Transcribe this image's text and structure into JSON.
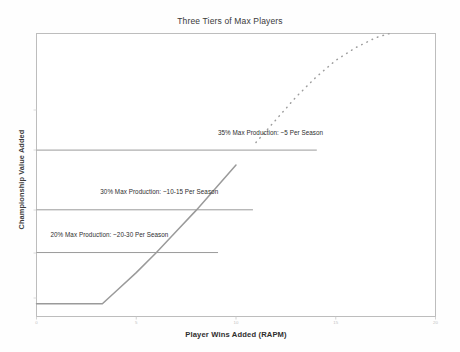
{
  "chart_data": {
    "type": "line",
    "title": "Three Tiers of Max Players",
    "xlabel": "Player Wins Added (RAPM)",
    "ylabel": "Championship Value Added",
    "xlim": [
      0,
      20
    ],
    "ylim": [
      0,
      1
    ],
    "grid": false,
    "legend": null,
    "xticks": [
      0,
      5,
      10,
      15,
      20
    ],
    "xtick_labels": [
      "0",
      "5",
      "10",
      "15",
      "20"
    ],
    "yticks": [],
    "ytick_labels": [],
    "series": [
      {
        "name": "Championship Value Curve",
        "style": "solid-then-dotted",
        "color": "#9a9a9a",
        "x": [
          0.0,
          1.0,
          2.0,
          3.0,
          3.3,
          4.0,
          5.0,
          6.0,
          7.0,
          8.0,
          9.0,
          10.0,
          11.0,
          12.0,
          13.0,
          14.0,
          15.0,
          16.0,
          17.0,
          17.7
        ],
        "y": [
          0.045,
          0.045,
          0.045,
          0.045,
          0.045,
          0.09,
          0.155,
          0.225,
          0.3,
          0.375,
          0.455,
          0.535,
          0.615,
          0.695,
          0.775,
          0.845,
          0.905,
          0.95,
          0.985,
          1.0
        ],
        "dotted_from_x": 10.2
      }
    ],
    "threshold_lines": [
      {
        "id": "tier-35",
        "label": "35% Max Production: ~5 Per Season",
        "y_value": 0.588,
        "x_start": 0,
        "x_end": 14.05,
        "label_x": 9.1,
        "label_y": 0.645,
        "color": "#8f8f8f"
      },
      {
        "id": "tier-30",
        "label": "30% Max Production: ~10-15 Per Season",
        "y_value": 0.377,
        "x_start": 0,
        "x_end": 10.85,
        "label_x": 3.2,
        "label_y": 0.435,
        "color": "#8f8f8f"
      },
      {
        "id": "tier-20",
        "label": "20% Max Production: ~20-30 Per Season",
        "y_value": 0.226,
        "x_start": 0,
        "x_end": 9.1,
        "label_x": 0.7,
        "label_y": 0.285,
        "color": "#8f8f8f"
      }
    ]
  },
  "figure": {
    "title": "Three Tiers of Max Players",
    "x_axis_label": "Player Wins Added (RAPM)",
    "y_axis_label": "Championship Value Added",
    "tick_0": "0",
    "tick_5": "5",
    "tick_10": "10",
    "tick_15": "15",
    "tick_20": "20",
    "annotation_35": "35% Max Production: ~5 Per Season",
    "annotation_30": "30% Max Production: ~10-15 Per Season",
    "annotation_20": "20% Max Production: ~20-30 Per Season",
    "border_color": "#bdbdbd",
    "curve_color": "#9a9a9a",
    "background": "#fefefe"
  }
}
